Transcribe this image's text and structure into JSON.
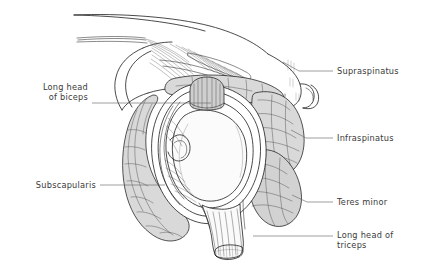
{
  "figure": {
    "background_color": "#ffffff",
    "ink_color": "#1d1d1d",
    "muscle_fill_color": "#d9d9d9",
    "label_color": "#3a3a3a",
    "leader_color": "#6a6a6a"
  },
  "labels": [
    {
      "id": "supraspinatus",
      "lines": [
        "Supraspinatus"
      ],
      "text_anchor": "start",
      "text_x": 337,
      "text_y": 74,
      "leader": "M 333 71 L 299 71 L 283 62"
    },
    {
      "id": "infraspinatus",
      "lines": [
        "Infraspinatus"
      ],
      "text_anchor": "start",
      "text_x": 337,
      "text_y": 141,
      "leader": "M 333 138 L 306 138 L 291 130"
    },
    {
      "id": "teres-minor",
      "lines": [
        "Teres minor"
      ],
      "text_anchor": "start",
      "text_x": 337,
      "text_y": 205,
      "leader": "M 333 202 L 307 202 L 292 195"
    },
    {
      "id": "long-head-of-triceps",
      "lines": [
        "Long head of",
        "triceps"
      ],
      "text_anchor": "start",
      "text_x": 337,
      "text_y": 238,
      "leader": "M 333 236 L 253 236"
    },
    {
      "id": "long-head-of-biceps",
      "lines": [
        "Long head",
        "of biceps"
      ],
      "text_anchor": "end",
      "text_x": 88,
      "text_y": 90,
      "leader": "M 92 103 L 211 103"
    },
    {
      "id": "subscapularis",
      "lines": [
        "Subscapularis"
      ],
      "text_anchor": "end",
      "text_x": 96,
      "text_y": 188,
      "leader": "M 100 185 L 165 185"
    }
  ],
  "structures": [
    {
      "id": "acromion-clavicle",
      "name": "acromion and clavicle arch"
    },
    {
      "id": "coracoacromial-ligament",
      "name": "coracoacromial ligament fibers"
    },
    {
      "id": "coracoid-process",
      "name": "coracoid process"
    },
    {
      "id": "supraspinatus-muscle",
      "name": "supraspinatus muscle belly"
    },
    {
      "id": "infraspinatus-muscle",
      "name": "infraspinatus muscle belly"
    },
    {
      "id": "teres-minor-muscle",
      "name": "teres minor muscle belly"
    },
    {
      "id": "subscapularis-muscle",
      "name": "subscapularis muscle belly"
    },
    {
      "id": "glenoid-fossa",
      "name": "glenoid fossa"
    },
    {
      "id": "glenoid-labrum",
      "name": "glenoid labrum rings"
    },
    {
      "id": "biceps-tendon",
      "name": "long head of biceps tendon cut end"
    },
    {
      "id": "triceps-tendon",
      "name": "long head of triceps tendon cut end"
    }
  ]
}
